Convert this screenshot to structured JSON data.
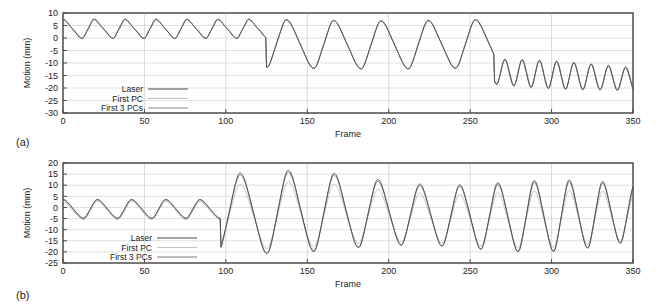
{
  "figure": {
    "panel_a_tag": "(a)",
    "panel_b_tag": "(b)"
  },
  "chart_data": [
    {
      "id": "panel_a",
      "type": "line",
      "title": "",
      "xlabel": "Frame",
      "ylabel": "Motion (mm)",
      "xlim": [
        0,
        350
      ],
      "ylim": [
        -30,
        10
      ],
      "xticks": [
        0,
        50,
        100,
        150,
        200,
        250,
        300,
        350
      ],
      "yticks": [
        10,
        5,
        0,
        -5,
        -10,
        -15,
        -20,
        -25,
        -30
      ],
      "grid": "horizontal-and-vertical",
      "legend": {
        "position": "lower-left",
        "entries": [
          "Laser",
          "First PC",
          "First 3 PCs"
        ]
      },
      "series": [
        {
          "name": "Laser",
          "color": "#4b4b4b",
          "width": 0.9,
          "x": [
            0,
            2,
            4,
            6,
            8,
            10,
            12,
            14,
            16,
            18,
            20,
            22,
            24,
            26,
            28,
            30,
            32,
            34,
            36,
            38,
            40,
            42,
            44,
            46,
            48,
            50,
            52,
            54,
            56,
            58,
            60,
            62,
            64,
            66,
            68,
            70,
            72,
            74,
            76,
            78,
            80,
            82,
            84,
            86,
            88,
            90,
            92,
            94,
            96,
            98,
            100,
            102,
            104,
            106,
            108,
            110,
            112,
            114,
            116,
            118,
            120,
            122,
            124,
            126,
            128,
            130,
            132,
            134,
            136,
            138,
            140,
            142,
            144,
            146,
            148,
            150,
            152,
            154,
            156,
            158,
            160,
            162,
            164,
            166,
            168,
            170,
            172,
            174,
            176,
            178,
            180,
            182,
            184,
            186,
            188,
            190,
            192,
            194,
            196,
            198,
            200,
            202,
            204,
            206,
            208,
            210,
            212,
            214,
            216,
            218,
            220,
            222,
            224,
            226,
            228,
            230,
            232,
            234,
            236,
            238,
            240,
            242,
            244,
            246,
            248,
            250,
            252,
            254,
            256,
            258,
            260,
            262,
            264,
            266,
            268,
            270,
            272,
            274,
            276,
            278,
            280,
            282,
            284,
            286,
            288,
            290,
            292,
            294,
            296,
            298,
            300,
            302,
            304,
            306,
            308,
            310,
            312,
            314,
            316,
            318,
            320,
            322,
            324,
            326,
            328,
            330,
            332,
            334,
            336,
            338,
            340,
            342,
            344,
            346,
            348,
            350
          ],
          "y": [
            -0.5,
            0.6,
            2.4,
            4.4,
            6.0,
            7.0,
            7.4,
            7.5,
            7.3,
            6.6,
            5.4,
            3.7,
            1.9,
            0.6,
            0.2,
            0.6,
            2.0,
            4.0,
            5.8,
            6.9,
            7.5,
            7.7,
            7.6,
            7.1,
            6.0,
            4.3,
            2.4,
            0.9,
            0.2,
            0.4,
            1.6,
            3.6,
            5.5,
            6.7,
            7.3,
            7.4,
            7.2,
            6.6,
            5.4,
            3.6,
            1.8,
            0.7,
            0.3,
            0.9,
            2.6,
            4.6,
            6.2,
            7.1,
            7.4,
            7.3,
            6.6,
            5.2,
            3.4,
            1.8,
            0.8,
            0.5,
            1.2,
            2.9,
            4.9,
            6.3,
            7.0,
            7.2,
            7.0,
            6.3,
            5.0,
            3.2,
            1.5,
            0.5,
            0.3,
            1.1,
            2.9,
            4.9,
            6.3,
            7.1,
            7.4,
            7.3,
            6.7,
            5.4,
            3.5,
            1.7,
            0.6,
            0.3,
            1.0,
            2.8,
            4.9,
            6.5,
            7.4,
            7.8,
            7.7,
            7.1,
            5.9,
            4.1,
            2.2,
            0.9,
            0.4,
            0.9,
            2.5,
            4.4,
            6.0,
            6.9,
            7.3,
            7.2,
            6.6,
            5.3,
            3.5,
            1.8,
            0.8,
            0.6,
            1.4,
            3.2,
            5.1,
            6.5,
            7.2,
            7.4,
            7.2,
            6.4,
            5.0,
            3.2,
            1.6,
            0.7,
            0.6,
            1.5,
            3.4,
            5.3,
            6.7,
            7.4,
            7.5,
            7.2,
            6.4,
            4.9,
            2.8,
            0.4,
            -2.4,
            -5.3,
            -8.0,
            -10.2,
            -11.6,
            -11.9,
            -11.0,
            -8.8,
            -5.6,
            -2.0,
            1.4,
            4.2,
            6.2,
            7.2,
            7.4,
            7.0,
            5.9,
            4.1,
            1.6,
            -1.4,
            -4.6,
            -7.7,
            -10.4,
            -12.5,
            -13.6,
            -13.5,
            -12.1,
            -9.4,
            -5.8,
            -2.0,
            1.5,
            4.4,
            6.4,
            7.4,
            7.6,
            7.2,
            6.2,
            4.4,
            1.9,
            -1.2,
            -4.3,
            -7.3,
            -9.9,
            -11.6,
            -12.2,
            -11.6,
            -9.8,
            -7.0,
            -3.5,
            0.1,
            3.3,
            5.7,
            7.1,
            7.6
          ]
        },
        {
          "name": "First PC",
          "color": "#b8b8b8",
          "width": 0.9,
          "note": "nearly coincident with Laser in panel (a)"
        },
        {
          "name": "First 3 PCs",
          "color": "#8a8a8a",
          "width": 0.9,
          "note": "nearly coincident with Laser in panel (a)"
        }
      ],
      "description": "Quasi-periodic respiratory motion trace. Frames 0-125 show regular breathing with peaks near +7 mm and troughs near 0 mm. Frames 125-265 show deep breaths reaching -12 to -14 mm with peaks near +7 mm. Frames 265-350 show rapid shallow oscillations between about -22 and -10 mm with a downward baseline drift."
    },
    {
      "id": "panel_b",
      "type": "line",
      "title": "",
      "xlabel": "Frame",
      "ylabel": "Motion (mm)",
      "xlim": [
        0,
        350
      ],
      "ylim": [
        -25,
        20
      ],
      "xticks": [
        0,
        50,
        100,
        150,
        200,
        250,
        300,
        350
      ],
      "yticks": [
        20,
        15,
        10,
        5,
        0,
        -5,
        -10,
        -15,
        -20,
        -25
      ],
      "grid": "horizontal-and-vertical",
      "legend": {
        "position": "lower-left",
        "entries": [
          "Laser",
          "First PC",
          "First 3 PCs"
        ]
      },
      "series": [
        {
          "name": "Laser",
          "color": "#4b4b4b",
          "width": 0.9
        },
        {
          "name": "First PC",
          "color": "#c0c0c0",
          "width": 0.9,
          "note": "undershoots Laser peaks and troughs after frame 100"
        },
        {
          "name": "First 3 PCs",
          "color": "#7d7d7d",
          "width": 0.9,
          "note": "closely tracks Laser"
        }
      ],
      "description": "Frames 0-95 show shallow breathing between about -6 and +5 mm. From frame 100 onward amplitude increases greatly, with peaks up to +16 mm and troughs down to -21 mm; the First PC reconstruction visibly underestimates the extremes while First 3 PCs follows the Laser closely."
    }
  ]
}
